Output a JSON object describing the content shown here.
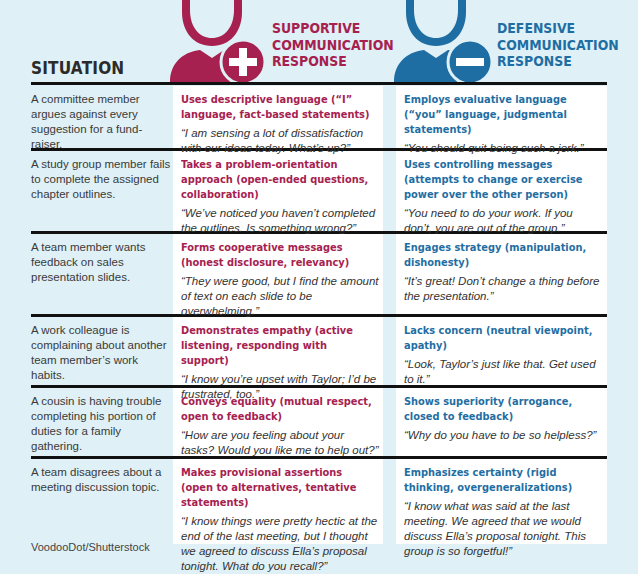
{
  "header": {
    "situation_label": "SITUATION",
    "supportive": {
      "line1": "SUPPORTIVE",
      "line2": "COMMUNICATION",
      "line3": "RESPONSE",
      "icon": "person-plus-icon",
      "color": "#a6214f"
    },
    "defensive": {
      "line1": "DEFENSIVE",
      "line2": "COMMUNICATION",
      "line3": "RESPONSE",
      "icon": "person-minus-icon",
      "color": "#1f6ea3"
    }
  },
  "rows": [
    {
      "situation": "A committee member argues against every suggestion for a fund-raiser.",
      "supportive": {
        "strategy": "Uses descriptive language (“I” language, fact-based statements)",
        "example": "“I am sensing a lot of dissatisfaction with our ideas today. What’s up?”"
      },
      "defensive": {
        "strategy": "Employs evaluative language (“you” language, judgmental statements)",
        "example": "“You should quit being such a jerk.”"
      }
    },
    {
      "situation": "A study group member fails to complete the assigned chapter outlines.",
      "supportive": {
        "strategy": "Takes a problem-orientation approach (open-ended questions, collaboration)",
        "example": "“We’ve noticed you haven’t completed the outlines. Is something wrong?”"
      },
      "defensive": {
        "strategy": "Uses controlling messages (attempts to change or exercise power over the other person)",
        "example": "“You need to do your work. If you don’t, you are out of the group.”"
      }
    },
    {
      "situation": "A team member wants feedback on sales presentation slides.",
      "supportive": {
        "strategy": "Forms cooperative messages (honest disclosure, relevancy)",
        "example": "“They were good, but I find the amount of text on each slide to be overwhelming.”"
      },
      "defensive": {
        "strategy": "Engages strategy (manipulation, dishonesty)",
        "example": "“It’s great! Don’t change a thing before the presentation.”"
      }
    },
    {
      "situation": "A work colleague is complaining about another team member’s work habits.",
      "supportive": {
        "strategy": "Demonstrates empathy (active listening, responding with support)",
        "example": "“I know you’re upset with Taylor; I’d be frustrated, too.”"
      },
      "defensive": {
        "strategy": "Lacks concern (neutral viewpoint, apathy)",
        "example": "“Look, Taylor’s just like that. Get used to it.”"
      }
    },
    {
      "situation": "A cousin is having trouble completing his portion of duties for a family gathering.",
      "supportive": {
        "strategy": "Conveys equality (mutual respect, open to feedback)",
        "example": "“How are you feeling about your tasks? Would you like me to help out?”"
      },
      "defensive": {
        "strategy": "Shows superiority (arrogance, closed to feedback)",
        "example": "“Why do you have to be so helpless?”"
      }
    },
    {
      "situation": "A team disagrees about a meeting discussion topic.",
      "supportive": {
        "strategy": "Makes provisional assertions (open to alternatives, tentative statements)",
        "example": "“I know things were pretty hectic at the end of the last meeting, but I thought we agreed to discuss Ella’s proposal tonight. What do you recall?”"
      },
      "defensive": {
        "strategy": "Emphasizes certainty (rigid thinking, overgeneralizations)",
        "example": "“I know what was said at the last meeting. We agreed that we would discuss Ella’s proposal tonight. This group is so forgetful!”"
      }
    }
  ],
  "credit": "VoodooDot/Shutterstock"
}
